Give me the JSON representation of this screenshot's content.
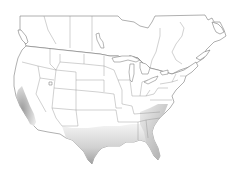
{
  "map": {
    "type": "species-range-map",
    "region": "North America (contiguous US and southern Canada)",
    "basemap_colors": {
      "background": "#ffffff",
      "land": "#ffffff",
      "outline": "#6e6e6e",
      "internal_borders": "#8a8a8a"
    },
    "range": {
      "fill_dark": "#9a9a9a",
      "fill_light": "#e6e6e6",
      "areas": [
        {
          "name": "California coast and Central Valley",
          "intensity": "high"
        },
        {
          "name": "Southern Texas / Gulf coast of Texas",
          "intensity": "high"
        },
        {
          "name": "Louisiana to Florida Gulf coast",
          "intensity": "medium"
        },
        {
          "name": "Florida peninsula",
          "intensity": "high"
        },
        {
          "name": "Georgia and Carolinas coastal plain",
          "intensity": "medium"
        },
        {
          "name": "Texas interior, Oklahoma, Arkansas",
          "intensity": "low"
        }
      ]
    },
    "legend": null,
    "labels": []
  }
}
